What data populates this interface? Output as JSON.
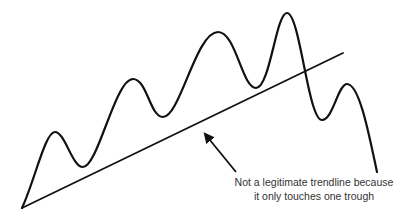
{
  "diagram": {
    "type": "price-chart-illustration",
    "colors": {
      "line": "#111111",
      "text": "#333333",
      "background": "#ffffff"
    },
    "price_path_points": [
      [
        22,
        208
      ],
      [
        55,
        132
      ],
      [
        83,
        167
      ],
      [
        133,
        79
      ],
      [
        163,
        117
      ],
      [
        218,
        32
      ],
      [
        256,
        88
      ],
      [
        287,
        13
      ],
      [
        322,
        120
      ],
      [
        347,
        84
      ],
      [
        377,
        172
      ]
    ],
    "trendline": {
      "x1": 22,
      "y1": 208,
      "x2": 343,
      "y2": 53
    },
    "arrow": {
      "from": [
        236,
        172
      ],
      "to": [
        203,
        132
      ]
    },
    "annotation": {
      "line1": "Not a legitimate trendline because",
      "line2": "it only touches one trough"
    }
  }
}
